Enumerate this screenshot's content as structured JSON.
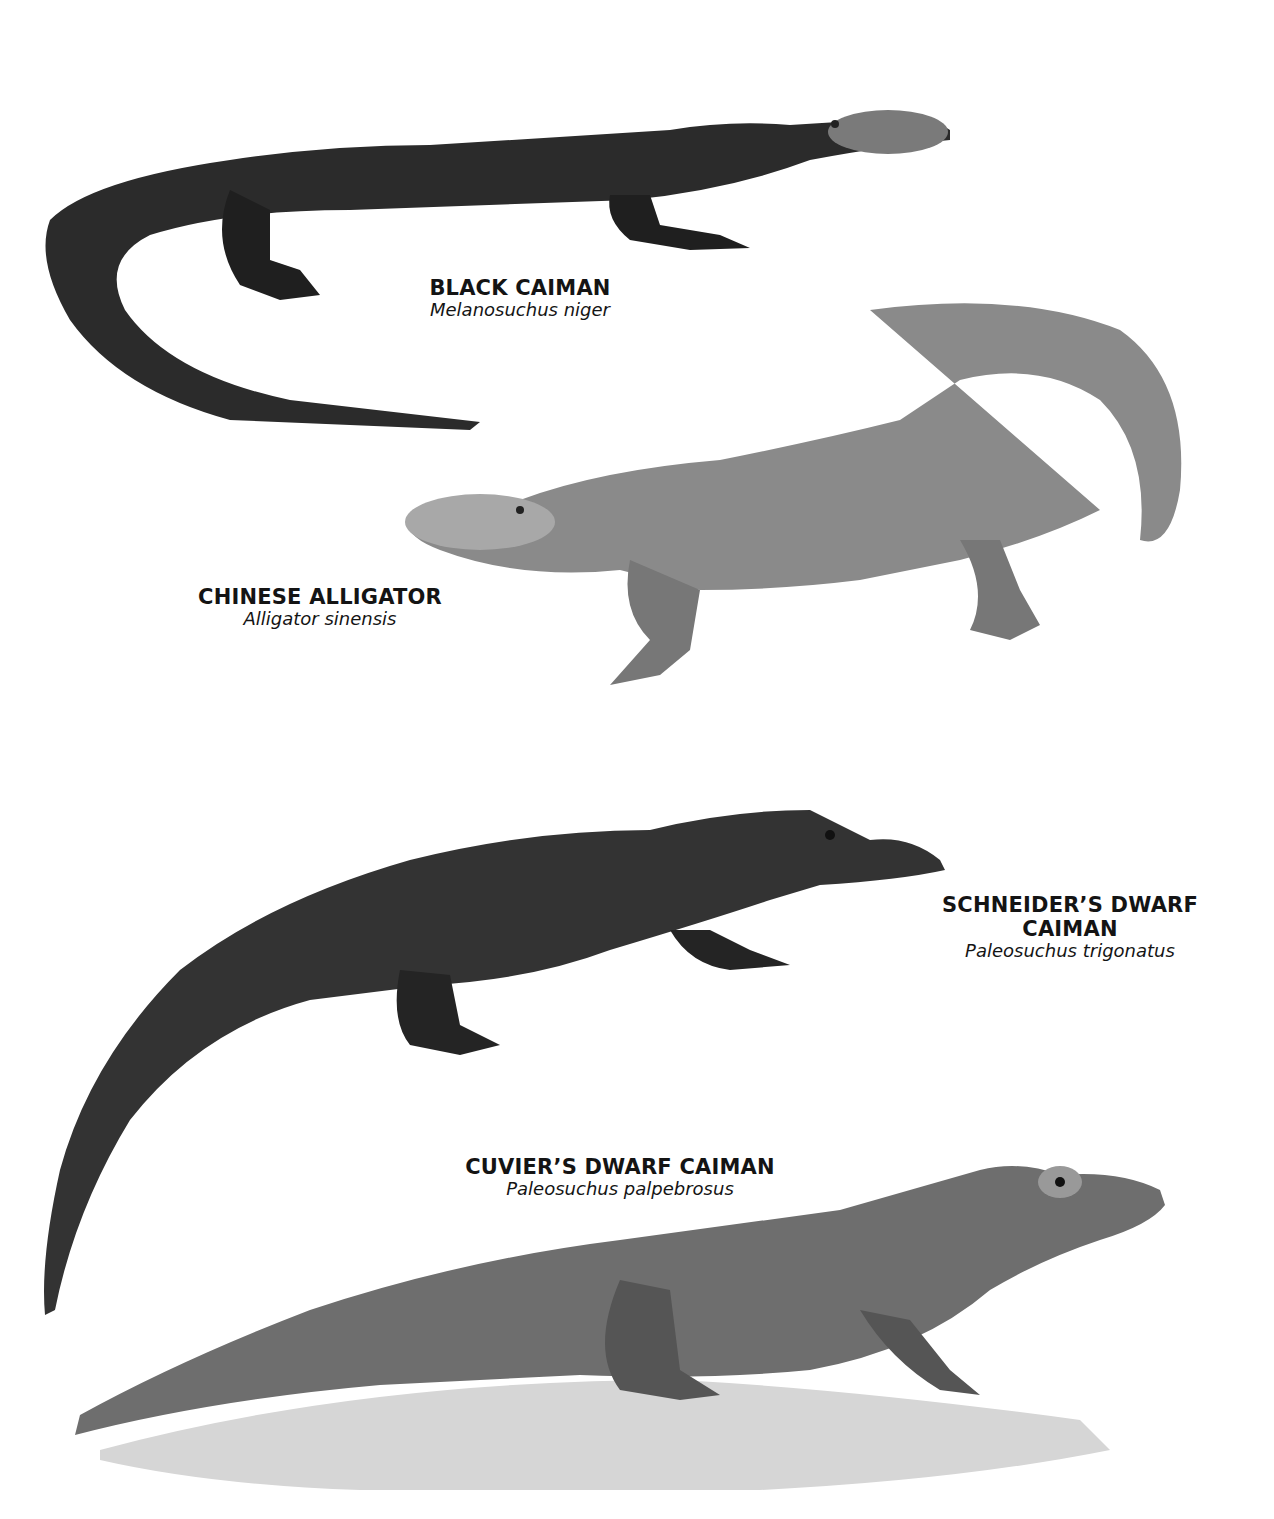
{
  "page": {
    "background": "#ffffff",
    "species": [
      {
        "common_name": "BLACK CAIMAN",
        "scientific_name": "Melanosuchus niger",
        "tone": "#2b2b2b"
      },
      {
        "common_name": "CHINESE ALLIGATOR",
        "scientific_name": "Alligator sinensis",
        "tone": "#8a8a8a"
      },
      {
        "common_name_line1": "SCHNEIDER’S DWARF",
        "common_name_line2": "CAIMAN",
        "scientific_name": "Paleosuchus trigonatus",
        "tone": "#333333"
      },
      {
        "common_name": "CUVIER’S DWARF CAIMAN",
        "scientific_name": "Paleosuchus palpebrosus",
        "tone": "#6e6e6e"
      }
    ]
  }
}
